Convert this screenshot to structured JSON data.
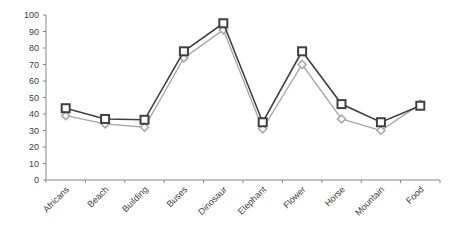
{
  "chart_data": {
    "type": "line",
    "title": "",
    "xlabel": "",
    "ylabel": "",
    "ylim": [
      0,
      100
    ],
    "yticks": [
      0,
      10,
      20,
      30,
      40,
      50,
      60,
      70,
      80,
      90,
      100
    ],
    "grid": false,
    "legend": null,
    "categories": [
      "Africans",
      "Beach",
      "Building",
      "Buses",
      "Dinosaur",
      "Elephant",
      "Flower",
      "Horse",
      "Mountain",
      "Food"
    ],
    "series": [
      {
        "name": "Series 1 (squares)",
        "marker": "square",
        "color": "#404040",
        "values": [
          43.5,
          37,
          36.5,
          78,
          95,
          35,
          78,
          46,
          35,
          45
        ]
      },
      {
        "name": "Series 2 (diamonds)",
        "marker": "diamond",
        "color": "#a6a6a6",
        "values": [
          39,
          34,
          32,
          74,
          91,
          31,
          70,
          37,
          30,
          46
        ]
      }
    ]
  }
}
